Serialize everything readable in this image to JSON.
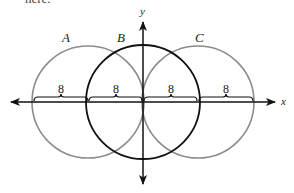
{
  "clipped_text": "here.",
  "diagram": {
    "axes": {
      "x_label": "x",
      "y_label": "y"
    },
    "circles": [
      {
        "label": "A",
        "cx": 88,
        "cy": 102,
        "r": 56,
        "color": "#8c8c8c"
      },
      {
        "label": "B",
        "cx": 143,
        "cy": 102,
        "r": 57,
        "color": "#111111"
      },
      {
        "label": "C",
        "cx": 198,
        "cy": 102,
        "r": 56,
        "color": "#8c8c8c"
      }
    ],
    "segments": [
      {
        "label": "8",
        "x1": 33,
        "x2": 88
      },
      {
        "label": "8",
        "x1": 88,
        "x2": 143
      },
      {
        "label": "8",
        "x1": 143,
        "x2": 198
      },
      {
        "label": "8",
        "x1": 198,
        "x2": 253
      }
    ]
  }
}
